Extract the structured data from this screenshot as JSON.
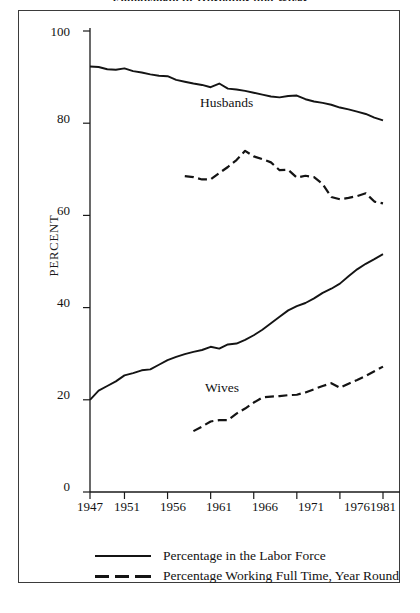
{
  "figure": {
    "title": "Employment of Husbands and Wives",
    "title_clipped": true
  },
  "axes": {
    "ylabel": "PERCENT",
    "yticks": [
      "0",
      "20",
      "40",
      "60",
      "80",
      "100"
    ],
    "xticks": [
      "1947",
      "1951",
      "1956",
      "1961",
      "1966",
      "1971",
      "1976",
      "1981"
    ]
  },
  "annotations": {
    "husbands": "Husbands",
    "wives": "Wives"
  },
  "legend": {
    "items": [
      {
        "label": "Percentage in the Labor Force",
        "style": "solid"
      },
      {
        "label": "Percentage Working Full Time, Year Round",
        "style": "dashed"
      }
    ]
  },
  "colors": {
    "line": "#141414",
    "frame": "#3b3b3b",
    "background": "#ffffff"
  },
  "chart_data": {
    "type": "line",
    "title": "Employment of Husbands and Wives",
    "xlabel": "",
    "ylabel": "PERCENT",
    "xlim": [
      1947,
      1981
    ],
    "ylim": [
      0,
      100
    ],
    "grid": false,
    "legend_position": "below-plot",
    "xticks": [
      1947,
      1951,
      1956,
      1961,
      1966,
      1971,
      1976,
      1981
    ],
    "yticks": [
      0,
      20,
      40,
      60,
      80,
      100
    ],
    "series": [
      {
        "name": "Husbands - Percentage in the Labor Force",
        "group": "Husbands",
        "style": "solid",
        "x": [
          1947,
          1948,
          1949,
          1950,
          1951,
          1952,
          1953,
          1954,
          1955,
          1956,
          1957,
          1958,
          1959,
          1960,
          1961,
          1962,
          1963,
          1964,
          1965,
          1966,
          1967,
          1968,
          1969,
          1970,
          1971,
          1972,
          1973,
          1974,
          1975,
          1976,
          1977,
          1978,
          1979,
          1980,
          1981
        ],
        "values": [
          92.3,
          92.2,
          91.7,
          91.6,
          91.9,
          91.3,
          91.0,
          90.6,
          90.3,
          90.2,
          89.4,
          89.0,
          88.6,
          88.3,
          87.8,
          88.6,
          87.5,
          87.3,
          87.0,
          86.6,
          86.2,
          85.8,
          85.6,
          85.9,
          86.0,
          85.2,
          84.7,
          84.4,
          84.0,
          83.4,
          83.0,
          82.5,
          82.0,
          81.2,
          80.6
        ]
      },
      {
        "name": "Husbands - Percentage Working Full Time, Year Round",
        "group": "Husbands",
        "style": "dashed",
        "x": [
          1958,
          1959,
          1960,
          1961,
          1962,
          1963,
          1964,
          1965,
          1966,
          1967,
          1968,
          1969,
          1970,
          1971,
          1972,
          1973,
          1974,
          1975,
          1976,
          1977,
          1978,
          1979,
          1980,
          1981
        ],
        "values": [
          68.5,
          68.3,
          67.8,
          67.8,
          69.2,
          70.5,
          72.0,
          74.0,
          72.8,
          72.2,
          71.5,
          69.8,
          69.9,
          68.2,
          68.6,
          68.3,
          66.8,
          64.0,
          63.5,
          63.8,
          64.2,
          64.8,
          63.0,
          62.6
        ]
      },
      {
        "name": "Wives - Percentage in the Labor Force",
        "group": "Wives",
        "style": "solid",
        "x": [
          1947,
          1948,
          1949,
          1950,
          1951,
          1952,
          1953,
          1954,
          1955,
          1956,
          1957,
          1958,
          1959,
          1960,
          1961,
          1962,
          1963,
          1964,
          1965,
          1966,
          1967,
          1968,
          1969,
          1970,
          1971,
          1972,
          1973,
          1974,
          1975,
          1976,
          1977,
          1978,
          1979,
          1980,
          1981
        ],
        "values": [
          20.0,
          22.0,
          23.0,
          24.0,
          25.3,
          25.8,
          26.4,
          26.6,
          27.6,
          28.6,
          29.3,
          29.9,
          30.4,
          30.8,
          31.5,
          31.1,
          32.0,
          32.2,
          33.0,
          34.0,
          35.2,
          36.6,
          38.0,
          39.4,
          40.3,
          41.0,
          42.0,
          43.2,
          44.1,
          45.2,
          46.8,
          48.3,
          49.5,
          50.5,
          51.6
        ]
      },
      {
        "name": "Wives - Percentage Working Full Time, Year Round",
        "group": "Wives",
        "style": "dashed",
        "x": [
          1959,
          1960,
          1961,
          1962,
          1963,
          1964,
          1965,
          1966,
          1967,
          1968,
          1969,
          1970,
          1971,
          1972,
          1973,
          1974,
          1975,
          1976,
          1977,
          1978,
          1979,
          1980,
          1981
        ],
        "values": [
          13.2,
          14.2,
          15.3,
          15.6,
          15.6,
          17.0,
          18.1,
          19.4,
          20.5,
          20.7,
          20.8,
          21.0,
          21.1,
          21.6,
          22.3,
          23.0,
          23.6,
          22.6,
          23.5,
          24.3,
          25.2,
          26.2,
          27.2
        ]
      }
    ]
  }
}
